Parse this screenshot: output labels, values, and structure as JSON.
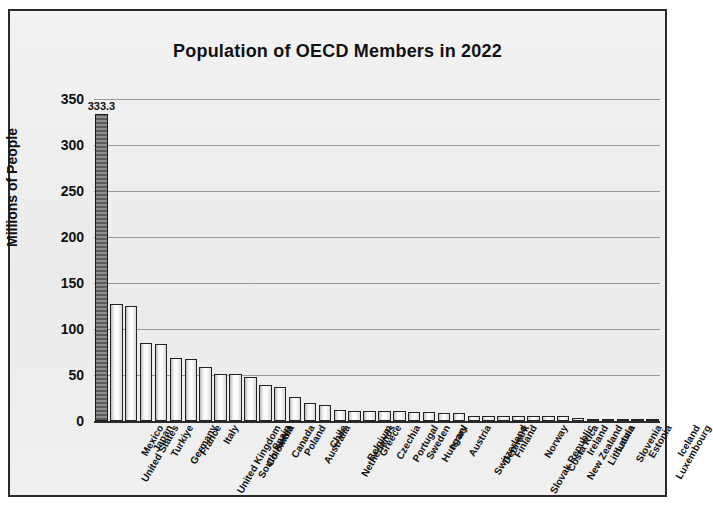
{
  "chart_data": {
    "type": "bar",
    "title": "Population of OECD Members in 2022",
    "xlabel": "",
    "ylabel": "Millions of People",
    "ylim": [
      0,
      350
    ],
    "yticks": [
      0,
      50,
      100,
      150,
      200,
      250,
      300,
      350
    ],
    "grid": true,
    "legend": "none",
    "highlight_category": "United States",
    "highlight_label": "333.3",
    "data_labels_shown": [
      "333.3"
    ],
    "categories": [
      "United States",
      "Mexico",
      "Japan",
      "Turkiye",
      "Germany",
      "France",
      "United Kingdom",
      "Italy",
      "South Korea",
      "Colombia",
      "Spain",
      "Canada",
      "Poland",
      "Australia",
      "Chile",
      "Netherlands",
      "Belgium",
      "Greece",
      "Czechia",
      "Portugal",
      "Sweden",
      "Hungary",
      "Israel",
      "Austria",
      "Switzerland",
      "Denmark",
      "Finland",
      "Slovak Republic",
      "Norway",
      "Costa Rica",
      "New Zealand",
      "Ireland",
      "Lithuania",
      "Latvia",
      "Slovenia",
      "Estonia",
      "Luxembourg",
      "Iceland"
    ],
    "values": [
      333.3,
      127.5,
      125.1,
      85.3,
      84.1,
      68.0,
      67.0,
      59.0,
      51.6,
      51.5,
      47.6,
      38.9,
      36.8,
      26.0,
      19.6,
      17.7,
      11.7,
      10.4,
      10.5,
      10.4,
      10.5,
      9.6,
      9.5,
      9.0,
      8.8,
      5.9,
      5.5,
      5.4,
      5.4,
      5.2,
      5.1,
      5.1,
      2.8,
      1.9,
      2.1,
      1.3,
      0.7,
      0.4
    ]
  },
  "colors": {
    "frame": "#2a2a2a",
    "plot_background": "#f0f0f0",
    "grid": "#9a9a9a",
    "axis": "#2b2b2b",
    "bar_fill": "#ffffff",
    "bar_edge": "#222222",
    "highlight_fill": "#6f6f6f",
    "text": "#111111"
  }
}
